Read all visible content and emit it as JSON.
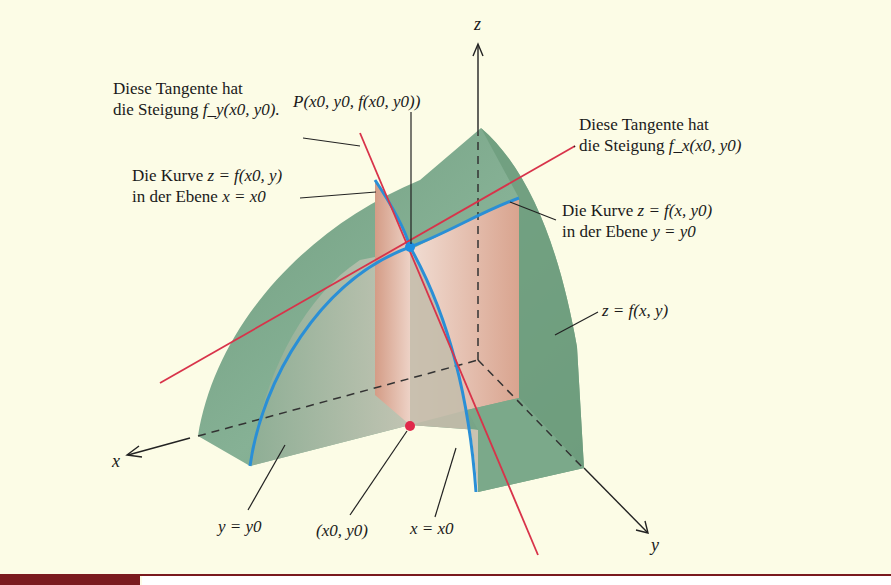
{
  "figure": {
    "axes": {
      "x": "x",
      "y": "y",
      "z": "z"
    },
    "labels": {
      "tangent_y_line1": "Diese Tangente hat",
      "tangent_y_line2_prefix": "die Steigung ",
      "tangent_y_formula": "f_y(x0, y0).",
      "point_P": "P(x0, y0, f(x0, y0))",
      "tangent_x_line1": "Diese Tangente hat",
      "tangent_x_line2_prefix": "die Steigung ",
      "tangent_x_formula": "f_x(x0, y0)",
      "curve_x0_line1_prefix": "Die Kurve ",
      "curve_x0_formula": "z = f(x0, y)",
      "curve_x0_line2_prefix": "in der Ebene ",
      "curve_x0_plane": "x = x0",
      "curve_y0_line1_prefix": "Die Kurve ",
      "curve_y0_formula": "z = f(x, y0)",
      "curve_y0_line2_prefix": "in der Ebene ",
      "curve_y0_plane": "y = y0",
      "surface": "z = f(x, y)",
      "plane_y0": "y = y0",
      "base_point": "(x0, y0)",
      "plane_x0": "x = x0"
    },
    "colors": {
      "background": "#fcfce6",
      "surface_green": "#7aa88a",
      "surface_dark": "#5f8c6e",
      "plane_pink": "#dba995",
      "curve_blue": "#2a8fd6",
      "tangent_red": "#d8334a",
      "point_blue": "#1f8fe0",
      "point_red": "#e0284a",
      "bar_maroon": "#7a1a1e"
    }
  }
}
